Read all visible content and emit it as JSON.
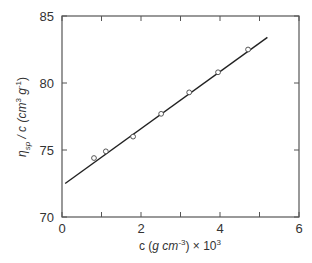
{
  "chart_data": {
    "type": "scatter",
    "title": "",
    "xlabel": "c (g cm⁻³) × 10³",
    "ylabel": "ηsp / c (cm³ g⁻¹)",
    "xlim": [
      0,
      6
    ],
    "ylim": [
      70,
      85
    ],
    "xticks": [
      0,
      2,
      4,
      6
    ],
    "xminor_ticks": [
      1,
      3,
      5
    ],
    "yticks": [
      70,
      75,
      80,
      85
    ],
    "grid": false,
    "legend": null,
    "series": [
      {
        "name": "data",
        "marker": "open-circle",
        "x": [
          0.81,
          1.11,
          1.8,
          2.51,
          3.22,
          3.95,
          4.71
        ],
        "y": [
          74.4,
          74.9,
          76.0,
          77.7,
          79.3,
          80.8,
          82.5
        ]
      },
      {
        "name": "linear fit",
        "style": "line",
        "x": [
          0.08,
          5.2
        ],
        "y": [
          72.5,
          83.4
        ]
      }
    ],
    "colors": {
      "axis": "#555555",
      "line": "#222222",
      "marker": "#444444"
    }
  },
  "labels": {
    "x_axis": {
      "prefix": "c (",
      "g": "g",
      "cm": " cm",
      "sup_exp": "-3",
      "suffix": ") × 10",
      "sup_pow": "3"
    },
    "y_axis": {
      "eta": "η",
      "eta_sub": "sp",
      "mid": " / c (cm",
      "sup1": "3",
      "g": " g",
      "sup2": "-1",
      "close": ")"
    }
  }
}
